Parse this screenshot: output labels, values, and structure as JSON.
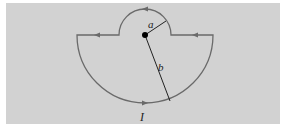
{
  "figure": {
    "labels": {
      "small_radius": "a",
      "large_radius": "b",
      "current": "I"
    },
    "colors": {
      "background": "#d2d2d2",
      "wire": "#6a6a6a",
      "radius_line": "#222222",
      "center_dot": "#000000"
    },
    "geometry": {
      "center": [
        145,
        35
      ],
      "radius_a": 26,
      "radius_b": 68
    }
  }
}
